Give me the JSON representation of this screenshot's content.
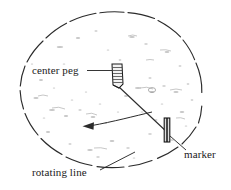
{
  "figure": {
    "background_color": "#ffffff",
    "ink_color": "#1a1a1a",
    "speckle_color": "#b9b9b9"
  },
  "labels": {
    "center_peg": "center peg",
    "marker": "marker",
    "rotating_line": "rotating line"
  },
  "parts": {
    "circle": {
      "name": "ground circle",
      "center_x": 111,
      "center_y": 90,
      "radius_x": 91,
      "radius_y": 78,
      "stroke_style": "dashed-hand-drawn"
    },
    "center_peg": {
      "x": 117,
      "y": 75,
      "width": 10,
      "height": 23
    },
    "marker": {
      "x": 167,
      "y": 130,
      "width": 6,
      "height": 24
    },
    "rotating_line": {
      "x1": 118,
      "y1": 88,
      "x2": 167,
      "y2": 133
    },
    "rotation_arrow": {
      "direction": "counter-clockwise",
      "arrow_tip_x": 84,
      "arrow_tip_y": 126
    }
  }
}
